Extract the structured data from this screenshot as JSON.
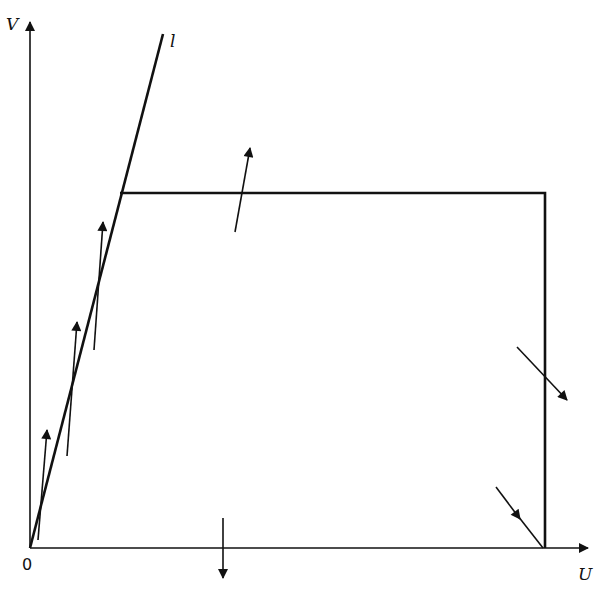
{
  "diagram": {
    "type": "phase-plane region with boundary vector field",
    "axes": {
      "x_label": "U",
      "y_label": "V",
      "origin_label": "0"
    },
    "line_label": "l",
    "region": {
      "description": "Quadrilateral bounded by line l, top horizontal edge, right vertical edge, and U axis",
      "vertices_px": [
        [
          30,
          548
        ],
        [
          120,
          193
        ],
        [
          545,
          193
        ],
        [
          545,
          548
        ]
      ]
    },
    "colors": {
      "ink": "#111111",
      "background": "#ffffff"
    },
    "arrows": [
      {
        "name": "arrow-on-l-1",
        "from": [
          38,
          540
        ],
        "to": [
          47,
          430
        ]
      },
      {
        "name": "arrow-on-l-2",
        "from": [
          67,
          456
        ],
        "to": [
          77,
          322
        ]
      },
      {
        "name": "arrow-on-l-3",
        "from": [
          94,
          350
        ],
        "to": [
          103,
          222
        ]
      },
      {
        "name": "arrow-top-edge",
        "from": [
          235,
          232
        ],
        "to": [
          250,
          148
        ]
      },
      {
        "name": "arrow-right-edge",
        "from": [
          517,
          347
        ],
        "to": [
          567,
          400
        ]
      },
      {
        "name": "arrow-corner",
        "from": [
          496,
          487
        ],
        "to": [
          520,
          519
        ]
      },
      {
        "name": "arrow-bottom-edge",
        "from": [
          223,
          518
        ],
        "to": [
          223,
          578
        ]
      }
    ]
  }
}
